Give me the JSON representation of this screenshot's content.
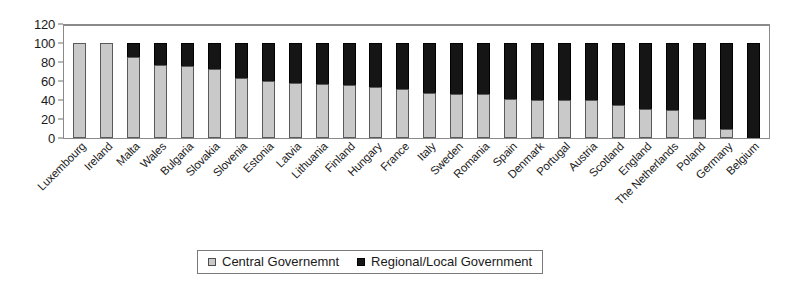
{
  "chart_data": {
    "type": "bar",
    "subtype": "stacked-column-100pct",
    "title": "",
    "xlabel": "",
    "ylabel": "",
    "ylim": [
      0,
      120
    ],
    "ytick_step": 20,
    "yticks": [
      0,
      20,
      40,
      60,
      80,
      100,
      120
    ],
    "grid": false,
    "legend_position": "bottom-center",
    "categories": [
      "Luxembourg",
      "Ireland",
      "Malta",
      "Wales",
      "Bulgaria",
      "Slovakia",
      "Slovenia",
      "Estonia",
      "Latvia",
      "Lithuania",
      "Finland",
      "Hungary",
      "France",
      "Italy",
      "Sweden",
      "Romania",
      "Spain",
      "Denmark",
      "Portugal",
      "Austria",
      "Scotland",
      "England",
      "The Netherlands",
      "Poland",
      "Germany",
      "Belgium"
    ],
    "series": [
      {
        "name": "Central Governemnt",
        "color": "#c9c9c9",
        "values": [
          100,
          100,
          85,
          77,
          76,
          73,
          63,
          60,
          58,
          57,
          56,
          54,
          52,
          47,
          46,
          46,
          41,
          40,
          40,
          40,
          35,
          31,
          30,
          20,
          9,
          0
        ]
      },
      {
        "name": "Regional/Local Government",
        "color": "#151515",
        "values": [
          0,
          0,
          15,
          23,
          24,
          27,
          37,
          40,
          42,
          43,
          44,
          46,
          48,
          53,
          54,
          54,
          59,
          60,
          60,
          60,
          65,
          69,
          70,
          80,
          91,
          100
        ]
      }
    ]
  },
  "legend": {
    "items": [
      {
        "label": "Central Governemnt",
        "swatch": "central-swatch"
      },
      {
        "label": "Regional/Local Government",
        "swatch": "regional-swatch"
      }
    ]
  }
}
